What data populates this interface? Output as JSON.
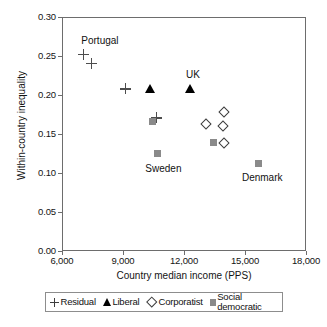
{
  "chart_data": {
    "type": "scatter",
    "title": "",
    "xlabel": "Country median income (PPS)",
    "ylabel": "Within-country inequality",
    "xlim": [
      6000,
      18000
    ],
    "ylim": [
      0.0,
      0.3
    ],
    "xticks": [
      "6,000",
      "9,000",
      "12,000",
      "15,000",
      "18,000"
    ],
    "xtick_values": [
      6000,
      9000,
      12000,
      15000,
      18000
    ],
    "yticks": [
      "0.00",
      "0.05",
      "0.10",
      "0.15",
      "0.20",
      "0.25",
      "0.30"
    ],
    "ytick_values": [
      0.0,
      0.05,
      0.1,
      0.15,
      0.2,
      0.25,
      0.3
    ],
    "grid": false,
    "legend_position": "below-axis",
    "series": [
      {
        "name": "Residual",
        "marker": "plus",
        "color": "#4d4d4d",
        "points": [
          {
            "x": 7000,
            "y": 0.253,
            "label": "Portugal"
          },
          {
            "x": 7400,
            "y": 0.242
          },
          {
            "x": 9050,
            "y": 0.209
          },
          {
            "x": 10600,
            "y": 0.172
          }
        ]
      },
      {
        "name": "Liberal",
        "marker": "triangle",
        "color": "#000000",
        "points": [
          {
            "x": 10300,
            "y": 0.209
          },
          {
            "x": 12250,
            "y": 0.209,
            "label": "UK"
          }
        ]
      },
      {
        "name": "Corporatist",
        "marker": "diamond",
        "color": "#3d3d3d",
        "points": [
          {
            "x": 13900,
            "y": 0.18
          },
          {
            "x": 13050,
            "y": 0.164
          },
          {
            "x": 13850,
            "y": 0.162
          },
          {
            "x": 13900,
            "y": 0.14
          }
        ]
      },
      {
        "name": "Social democratic",
        "marker": "square",
        "color": "#8a8a8a",
        "points": [
          {
            "x": 10400,
            "y": 0.167
          },
          {
            "x": 10650,
            "y": 0.126,
            "label": "Sweden"
          },
          {
            "x": 13400,
            "y": 0.14
          },
          {
            "x": 15600,
            "y": 0.114,
            "label": "Denmark"
          }
        ]
      }
    ],
    "annotations": [
      {
        "text": "Portugal",
        "x": 6900,
        "y": 0.272,
        "align": "left"
      },
      {
        "text": "UK",
        "x": 12050,
        "y": 0.228,
        "align": "left"
      },
      {
        "text": "Sweden",
        "x": 10050,
        "y": 0.108,
        "align": "left"
      },
      {
        "text": "Denmark",
        "x": 14800,
        "y": 0.096,
        "align": "left"
      }
    ]
  },
  "legend": {
    "entries": [
      {
        "label": "Residual",
        "marker": "plus"
      },
      {
        "label": "Liberal",
        "marker": "triangle"
      },
      {
        "label": "Corporatist",
        "marker": "diamond"
      },
      {
        "label": "Social democratic",
        "marker": "square"
      }
    ]
  }
}
